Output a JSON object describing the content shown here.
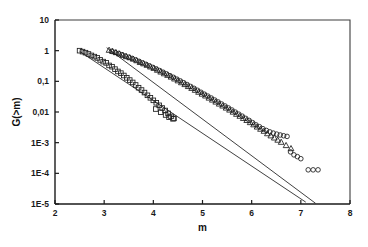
{
  "figure": {
    "background_color": "#ffffff",
    "foreground_color": "#1a1a1a"
  },
  "chart_data": {
    "type": "scatter",
    "title": "",
    "xlabel": "m",
    "ylabel": "G(>m)",
    "xlim": [
      2,
      8
    ],
    "ylim": [
      1e-05,
      10
    ],
    "yscale": "log",
    "xscale": "linear",
    "grid": false,
    "legend": "none",
    "xticks": [
      2,
      3,
      4,
      5,
      6,
      7,
      8
    ],
    "xticklabels": [
      "2",
      "3",
      "4",
      "5",
      "6",
      "7",
      "8"
    ],
    "yticks": [
      10,
      1,
      0.1,
      0.01,
      0.001,
      0.0001,
      1e-05
    ],
    "yticklabels": [
      "10",
      "1",
      "0,1",
      "0,01",
      "1E-3",
      "1E-4",
      "1E-5"
    ],
    "series": [
      {
        "name": "series-squares",
        "marker": "square",
        "x": [
          2.5,
          2.56,
          2.62,
          2.68,
          2.74,
          2.8,
          2.86,
          2.92,
          2.98,
          3.04,
          3.1,
          3.16,
          3.22,
          3.28,
          3.34,
          3.4,
          3.46,
          3.52,
          3.58,
          3.64,
          3.7,
          3.76,
          3.82,
          3.88,
          3.94,
          4.0,
          4.06,
          4.12,
          4.18,
          4.24,
          4.3,
          4.36,
          4.42
        ],
        "y": [
          1.0,
          0.93,
          0.86,
          0.78,
          0.7,
          0.64,
          0.58,
          0.5,
          0.44,
          0.4,
          0.33,
          0.3,
          0.25,
          0.21,
          0.185,
          0.155,
          0.13,
          0.11,
          0.092,
          0.076,
          0.062,
          0.052,
          0.043,
          0.035,
          0.029,
          0.024,
          0.02,
          0.0165,
          0.0135,
          0.0112,
          0.009,
          0.0072,
          0.0062
        ]
      },
      {
        "name": "series-triangles",
        "marker": "triangle",
        "x": [
          3.1,
          3.17,
          3.24,
          3.31,
          3.38,
          3.45,
          3.52,
          3.59,
          3.66,
          3.73,
          3.8,
          3.87,
          3.94,
          4.01,
          4.08,
          4.15,
          4.22,
          4.29,
          4.36,
          4.43,
          4.5,
          4.57,
          4.64,
          4.71,
          4.78,
          4.85,
          4.92,
          4.99,
          5.06,
          5.13,
          5.2,
          5.27,
          5.34,
          5.41,
          5.48,
          5.55,
          5.62,
          5.69,
          5.76,
          5.83,
          5.9,
          5.97,
          6.04,
          6.11,
          6.18,
          6.25,
          6.32,
          6.39,
          6.46,
          6.53,
          6.6,
          6.7,
          6.8
        ],
        "y": [
          1.05,
          0.97,
          0.88,
          0.8,
          0.72,
          0.65,
          0.6,
          0.54,
          0.48,
          0.42,
          0.38,
          0.34,
          0.3,
          0.27,
          0.235,
          0.205,
          0.18,
          0.16,
          0.14,
          0.122,
          0.106,
          0.092,
          0.08,
          0.069,
          0.06,
          0.052,
          0.045,
          0.039,
          0.034,
          0.029,
          0.025,
          0.0215,
          0.0185,
          0.016,
          0.0137,
          0.0118,
          0.0101,
          0.0086,
          0.0074,
          0.0063,
          0.0054,
          0.0046,
          0.0039,
          0.0033,
          0.0028,
          0.0024,
          0.002,
          0.0017,
          0.00145,
          0.00123,
          0.00105,
          0.00082,
          0.00065
        ]
      },
      {
        "name": "series-circles",
        "marker": "circle",
        "x": [
          3.15,
          3.22,
          3.29,
          3.36,
          3.43,
          3.5,
          3.57,
          3.64,
          3.71,
          3.78,
          3.85,
          3.92,
          3.99,
          4.06,
          4.13,
          4.2,
          4.27,
          4.34,
          4.41,
          4.48,
          4.55,
          4.62,
          4.69,
          4.76,
          4.83,
          4.9,
          4.97,
          5.04,
          5.11,
          5.18,
          5.25,
          5.32,
          5.39,
          5.46,
          5.53,
          5.6,
          5.67,
          5.74,
          5.81,
          5.88,
          5.95,
          6.02,
          6.09,
          6.16,
          6.23,
          6.3,
          6.37,
          6.44,
          6.51,
          6.58,
          6.65,
          6.72,
          6.79,
          6.86,
          6.93,
          7.0,
          7.15,
          7.25,
          7.35
        ],
        "y": [
          0.95,
          0.88,
          0.81,
          0.74,
          0.67,
          0.61,
          0.56,
          0.5,
          0.45,
          0.4,
          0.36,
          0.32,
          0.285,
          0.255,
          0.225,
          0.198,
          0.175,
          0.153,
          0.135,
          0.118,
          0.103,
          0.09,
          0.078,
          0.068,
          0.059,
          0.051,
          0.044,
          0.038,
          0.033,
          0.0285,
          0.0245,
          0.0212,
          0.0182,
          0.0157,
          0.0135,
          0.0116,
          0.0099,
          0.0085,
          0.0073,
          0.0062,
          0.0053,
          0.0045,
          0.0038,
          0.0033,
          0.00285,
          0.0025,
          0.00225,
          0.00205,
          0.0019,
          0.00178,
          0.00168,
          0.0016,
          0.0005,
          0.0004,
          0.00035,
          0.0003,
          0.00013,
          0.00013,
          0.00013
        ]
      },
      {
        "name": "series-squares-branch",
        "marker": "square",
        "x": [
          4.05,
          4.15,
          4.25,
          4.32,
          4.4
        ],
        "y": [
          0.0125,
          0.0098,
          0.008,
          0.0068,
          0.006
        ]
      }
    ],
    "fit_lines": [
      {
        "name": "fit-line-upper",
        "x0": 3.05,
        "y0": 1.25,
        "x1": 7.3,
        "y1": 1.05e-05
      },
      {
        "name": "fit-line-lower",
        "x0": 2.5,
        "y0": 0.95,
        "x1": 7.1,
        "y1": 1.15e-05
      }
    ]
  }
}
